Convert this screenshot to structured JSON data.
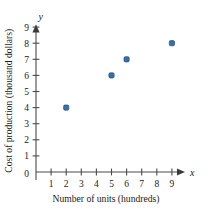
{
  "chart_data": {
    "type": "scatter",
    "title": "",
    "xlabel": "Number of units (hundreds)",
    "ylabel": "Cost of production (thousand dollars)",
    "x_axis_variable": "x",
    "y_axis_variable": "y",
    "origin_label": "0",
    "xlim": [
      0,
      9.8
    ],
    "ylim": [
      0,
      9.6
    ],
    "x_ticks": [
      1,
      2,
      3,
      4,
      5,
      6,
      7,
      8,
      9
    ],
    "y_ticks": [
      1,
      2,
      3,
      4,
      5,
      6,
      7,
      8,
      9
    ],
    "x_tick_labels": [
      "1",
      "2",
      "3",
      "4",
      "5",
      "6",
      "7",
      "8",
      "9"
    ],
    "y_tick_labels": [
      "1",
      "2",
      "3",
      "4",
      "5",
      "6",
      "7",
      "8",
      "9"
    ],
    "grid": false,
    "legend": false,
    "marker_color": "#3a6ea5",
    "marker_edge_color": "#1f4e85",
    "axis_color": "#4a4a4a",
    "points": [
      {
        "x": 2,
        "y": 4
      },
      {
        "x": 5,
        "y": 6
      },
      {
        "x": 6,
        "y": 7
      },
      {
        "x": 9,
        "y": 8
      }
    ]
  }
}
